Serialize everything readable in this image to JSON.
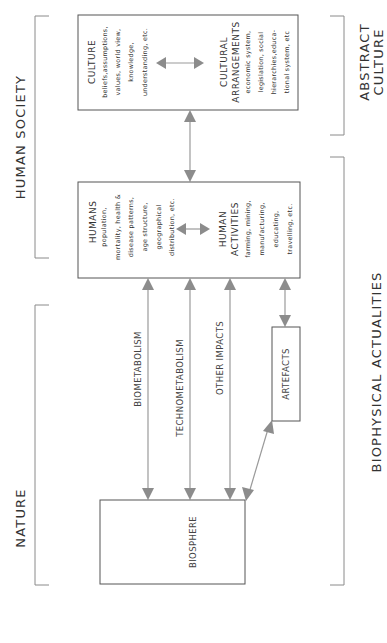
{
  "diagram": {
    "orientation": "rotated-90-ccw",
    "colors": {
      "box_stroke": "#555555",
      "arrow": "#8c8c8c",
      "bracket": "#8a8a8a",
      "text": "#333333"
    },
    "sections_left": {
      "human_society": "HUMAN SOCIETY",
      "nature": "NATURE"
    },
    "sections_right": {
      "abstract_culture_line1": "ABSTRACT",
      "abstract_culture_line2": "CULTURE",
      "biophysical_actualities": "BIOPHYSICAL ACTUALITIES"
    },
    "boxes": {
      "culture": {
        "title": "CULTURE",
        "lines": [
          "beliefs,assumptions,",
          "values, world view,",
          "knowledge,",
          "understanding, etc."
        ]
      },
      "cultural_arrangements": {
        "title_line1": "CULTURAL",
        "title_line2": "ARRANGEMENTS",
        "lines": [
          "economic system,",
          "legislation, social",
          "hierarchies,educa-",
          "tional system, etc"
        ]
      },
      "humans": {
        "title": "HUMANS",
        "lines": [
          "population,",
          "mortality, health &",
          "disease patterns,",
          "age structure,",
          "geographical",
          "distribution, etc."
        ]
      },
      "human_activities": {
        "title_line1": "HUMAN",
        "title_line2": "ACTIVITIES",
        "lines": [
          "farming, mining,",
          "manufacturing,",
          "educating,",
          "travelling, etc."
        ]
      },
      "artefacts": {
        "title": "ARTEFACTS"
      },
      "biosphere": {
        "title": "BIOSPHERE"
      }
    },
    "arrows": {
      "biometabolism": "BIOMETABOLISM",
      "technometabolism": "TECHNOMETABOLISM",
      "other_impacts": "OTHER IMPACTS"
    }
  }
}
